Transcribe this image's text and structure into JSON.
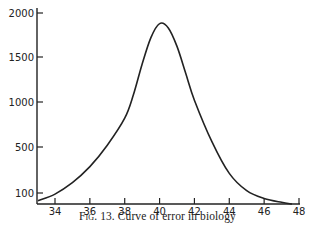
{
  "chart_data": {
    "type": "line",
    "title": "",
    "caption_prefix": "Fig. 13.",
    "caption_text": "Curve of error in biology",
    "xlabel": "",
    "ylabel": "",
    "x_ticks": [
      34,
      36,
      38,
      40,
      42,
      44,
      46,
      48
    ],
    "y_ticks": [
      100,
      500,
      1000,
      1500,
      2000
    ],
    "xlim": [
      33,
      48
    ],
    "ylim": [
      0,
      2000
    ],
    "grid": false,
    "legend": null,
    "series": [
      {
        "name": "Curve of error",
        "x": [
          33,
          34,
          35,
          36,
          37,
          38,
          38.5,
          39,
          39.5,
          40,
          40.5,
          41,
          41.5,
          42,
          43,
          44,
          45,
          46,
          47,
          47.6
        ],
        "y": [
          30,
          90,
          190,
          330,
          520,
          820,
          1080,
          1420,
          1720,
          1880,
          1830,
          1620,
          1320,
          1020,
          560,
          270,
          120,
          50,
          15,
          0
        ]
      }
    ],
    "color": "#222222"
  }
}
